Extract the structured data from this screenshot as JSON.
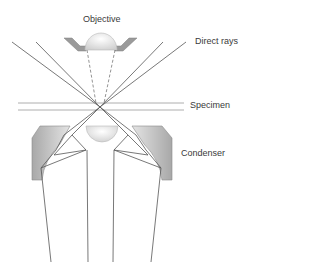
{
  "diagram": {
    "type": "darkfield-microscope-optics",
    "labels": {
      "objective": "Objective",
      "direct_rays": "Direct rays",
      "specimen": "Specimen",
      "condenser": "Condenser"
    },
    "colors": {
      "ray": "#555555",
      "housing_fill": "#b8b8b8",
      "housing_stroke": "#8a8a8a",
      "lens_fill": "#eeeeee",
      "specimen_line": "#999999",
      "text": "#3a3a3a"
    }
  }
}
